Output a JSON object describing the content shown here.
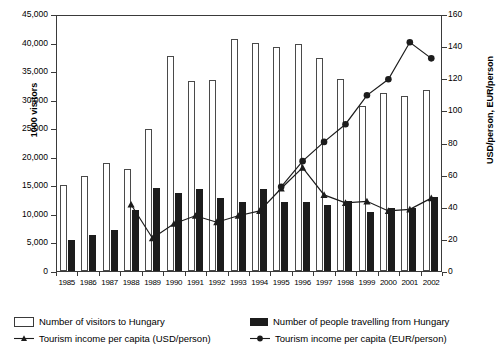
{
  "chart_data": {
    "type": "bar",
    "title": "",
    "subtitle": "",
    "categories": [
      "1985",
      "1986",
      "1987",
      "1988",
      "1989",
      "1990",
      "1991",
      "1992",
      "1993",
      "1994",
      "1995",
      "1996",
      "1997",
      "1998",
      "1999",
      "2000",
      "2001",
      "2002"
    ],
    "xlabel": "",
    "ylabel": "1000 visitors",
    "ylabel_right": "USD/person, EUR/person",
    "ylim": [
      0,
      45000
    ],
    "ylim_right": [
      0,
      160
    ],
    "yticks": [
      "0",
      "5,000",
      "10,000",
      "15,000",
      "20,000",
      "25,000",
      "30,000",
      "35,000",
      "40,000",
      "45,000"
    ],
    "ytick_values": [
      0,
      5000,
      10000,
      15000,
      20000,
      25000,
      30000,
      35000,
      40000,
      45000
    ],
    "yticks_right": [
      "0",
      "20",
      "40",
      "60",
      "80",
      "100",
      "120",
      "140",
      "160"
    ],
    "ytick_values_right": [
      0,
      20,
      40,
      60,
      80,
      100,
      120,
      140,
      160
    ],
    "grid": false,
    "legend_position": "bottom",
    "series": [
      {
        "name": "Number of visitors to Hungary",
        "kind": "bar",
        "style": "open",
        "axis": "left",
        "color": "#ffffff",
        "edge_color": "#4a4a4a",
        "values": [
          15100,
          16600,
          19000,
          17900,
          24900,
          37600,
          33300,
          33500,
          40600,
          39900,
          39200,
          39800,
          37300,
          33600,
          28900,
          31100,
          30700,
          31700
        ]
      },
      {
        "name": "Number of people travelling from Hungary",
        "kind": "bar",
        "style": "solid",
        "axis": "left",
        "color": "#1c1c1c",
        "values": [
          5400,
          6300,
          7200,
          10600,
          14500,
          13600,
          14400,
          12800,
          12100,
          14400,
          12100,
          12000,
          11600,
          12300,
          10400,
          11000,
          11100,
          12900
        ]
      },
      {
        "name": "Tourism income per capita (USD/person)",
        "kind": "line",
        "marker": "triangle",
        "axis": "right",
        "color": "#1c1c1c",
        "values": [
          null,
          null,
          null,
          42,
          21,
          30,
          35,
          31,
          35,
          38,
          52,
          65,
          48,
          43,
          44,
          38,
          39,
          46
        ]
      },
      {
        "name": "Tourism income per capita (EUR/person)",
        "kind": "line",
        "marker": "circle",
        "axis": "right",
        "color": "#1c1c1c",
        "values": [
          null,
          null,
          null,
          null,
          null,
          null,
          null,
          null,
          null,
          null,
          53,
          69,
          81,
          92,
          110,
          120,
          143,
          133
        ]
      }
    ]
  },
  "legend": {
    "items": [
      {
        "label": "Number of visitors to Hungary",
        "marker": "open-square"
      },
      {
        "label": "Number of people travelling from Hungary",
        "marker": "solid-square"
      },
      {
        "label": "Tourism income per capita (USD/person)",
        "marker": "line-triangle"
      },
      {
        "label": "Tourism income per capita (EUR/person)",
        "marker": "line-circle"
      }
    ]
  },
  "colors": {
    "axis": "#3a3a3a",
    "ink": "#1c1c1c",
    "background": "#ffffff"
  }
}
